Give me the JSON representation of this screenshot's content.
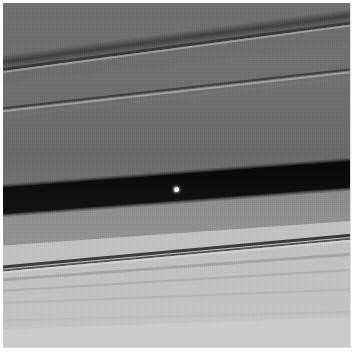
{
  "image": {
    "title": "Saturn's A ring with the Keeler Gap",
    "subject": "planetary-ring-system",
    "capture_style": "grayscale spacecraft imaging",
    "width_px": 352,
    "height_px": 361,
    "alt_text": "Grayscale close-up of Saturn's rings showing fine banded ringlets crossing the frame diagonally, a wide black gap across the middle, and a single tiny bright point of light inside the gap."
  },
  "frame": {
    "border_color": "#ffffff",
    "content_left_px": 3,
    "content_top_px": 3,
    "content_width_px": 348,
    "content_height_px": 345
  },
  "palette": {
    "outer_ring_gray": "#6d6d6d",
    "mid_ring_gray": "#707070",
    "inner_edge_gray": "#8a8a8a",
    "bright_ring_gray": "#bdbdbd",
    "bottom_gray": "#c6c6c6",
    "gap_black": "#070707",
    "moon_white": "#ffffff",
    "ringlet_dark": "#2e2e2e",
    "ringlet_bright": "#cfcfcf",
    "page_white": "#ffffff"
  },
  "features": {
    "gap": {
      "name": "keeler-gap",
      "label": "Keeler Gap",
      "color": "#070707",
      "left_edge_top_y": 184,
      "left_edge_bottom_y": 210,
      "right_edge_top_y": 157,
      "right_edge_bottom_y": 182,
      "tilt_deg": -4.35,
      "thickness_px": 26
    },
    "moon": {
      "name": "daphnis-moon",
      "label": "small embedded moon",
      "color": "#ffffff",
      "x_px": 173,
      "y_px": 186,
      "diameter_px": 5,
      "glow": "soft white halo"
    },
    "ringlets": [
      {
        "name": "upper-shadow-band",
        "tone": "dark",
        "tilt_deg": -7.6,
        "left_y": 44,
        "right_y": 3,
        "strength": "strong diffuse"
      },
      {
        "name": "upper-edge-dark-1",
        "tone": "dark",
        "tilt_deg": -7.6,
        "left_y": 57,
        "right_y": 16,
        "strength": "sharp"
      },
      {
        "name": "upper-edge-bright-1",
        "tone": "bright",
        "tilt_deg": -7.6,
        "left_y": 60,
        "right_y": 19,
        "strength": "sharp"
      },
      {
        "name": "mid-edge-dark-2",
        "tone": "dark",
        "tilt_deg": -6.4,
        "left_y": 100,
        "right_y": 66,
        "strength": "sharp"
      },
      {
        "name": "mid-edge-bright-2",
        "tone": "bright",
        "tilt_deg": -6.4,
        "left_y": 103,
        "right_y": 69,
        "strength": "medium"
      },
      {
        "name": "mid-faint-band",
        "tone": "faint",
        "tilt_deg": -6.4,
        "left_y": 108,
        "right_y": 74,
        "strength": "faint"
      },
      {
        "name": "lower-ringlet-dark-a",
        "tone": "dark",
        "tilt_deg": -5.2,
        "left_y": 259,
        "right_y": 231,
        "strength": "strongest thin line"
      },
      {
        "name": "lower-ringlet-dark-b",
        "tone": "dark",
        "tilt_deg": -5.2,
        "left_y": 262,
        "right_y": 234,
        "strength": "medium"
      },
      {
        "name": "lower-ringlet-bright",
        "tone": "bright",
        "tilt_deg": -5.2,
        "left_y": 265,
        "right_y": 237,
        "strength": "medium"
      },
      {
        "name": "lower-faint-1",
        "tone": "faint",
        "tilt_deg": -4.2,
        "left_y": 274,
        "right_y": 252,
        "strength": "faint"
      },
      {
        "name": "lower-faint-2",
        "tone": "faint",
        "tilt_deg": -3.4,
        "left_y": 288,
        "right_y": 270,
        "strength": "faint"
      },
      {
        "name": "lower-faint-3",
        "tone": "faint",
        "tilt_deg": -2.2,
        "left_y": 304,
        "right_y": 292,
        "strength": "very faint"
      },
      {
        "name": "lower-faint-4",
        "tone": "faint",
        "tilt_deg": -1.4,
        "left_y": 324,
        "right_y": 316,
        "strength": "very faint"
      }
    ],
    "zones": [
      {
        "name": "outer-a-ring",
        "label": "outer A ring",
        "color": "#6d6d6d",
        "top_y": 3,
        "bottom_y": 95
      },
      {
        "name": "mid-a-ring",
        "label": "mid A ring",
        "color": "#707070",
        "top_y": 95,
        "bottom_y": 165
      },
      {
        "name": "gap-inner-edge",
        "label": "gap inner edge",
        "color": "#8a8a8a",
        "top_y": 165,
        "bottom_y": 215
      },
      {
        "name": "bright-ringlet-zone",
        "label": "bright ringlet zone",
        "color": "#bdbdbd",
        "top_y": 215,
        "bottom_y": 290
      },
      {
        "name": "inner-bright-ring",
        "label": "inner bright ring",
        "color": "#c6c6c6",
        "top_y": 290,
        "bottom_y": 348
      }
    ]
  }
}
